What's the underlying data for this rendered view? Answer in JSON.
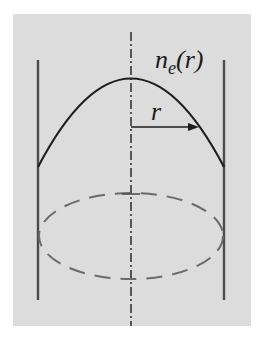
{
  "figure": {
    "background": "#dcdcdc",
    "label_profile": "n",
    "label_profile_sub": "e",
    "label_profile_arg": "(r)",
    "label_radius": "r",
    "colors": {
      "curve": "#1e1e1e",
      "walls": "#4a4a4a",
      "axis": "#2a2a2a",
      "ellipse": "#6a6a6a"
    }
  }
}
